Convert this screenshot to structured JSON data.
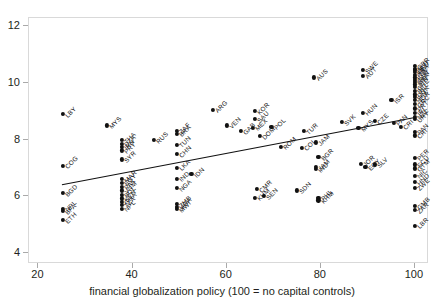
{
  "chart_data": {
    "type": "scatter",
    "title": "",
    "xlabel": "financial globalization policy (100 = no capital controls)",
    "ylabel": "",
    "xlim": [
      18,
      103
    ],
    "ylim": [
      3.6,
      12.3
    ],
    "xticks": [
      20,
      40,
      60,
      80,
      100
    ],
    "yticks": [
      4,
      6,
      8,
      10,
      12
    ],
    "grid": false,
    "legend": null,
    "point_color": "#111111",
    "fit_line": {
      "label": "linear fit",
      "x": [
        25,
        100
      ],
      "y": [
        6.4,
        8.78
      ],
      "color": "#111111"
    },
    "points": [
      {
        "label": "LBY",
        "x": 25.2,
        "y": 8.9
      },
      {
        "label": "COG",
        "x": 25.2,
        "y": 7.08
      },
      {
        "label": "BGD",
        "x": 25.2,
        "y": 6.1
      },
      {
        "label": "NPL",
        "x": 25.2,
        "y": 5.55
      },
      {
        "label": "BFA",
        "x": 25.2,
        "y": 5.47
      },
      {
        "label": "ETH",
        "x": 25.2,
        "y": 5.15
      },
      {
        "label": "MYS",
        "x": 34.5,
        "y": 8.5
      },
      {
        "label": "THA",
        "x": 37.8,
        "y": 7.98
      },
      {
        "label": "DZA",
        "x": 37.8,
        "y": 7.86
      },
      {
        "label": "IRN",
        "x": 37.8,
        "y": 7.74
      },
      {
        "label": "PRY",
        "x": 37.8,
        "y": 7.62
      },
      {
        "label": "SYR",
        "x": 37.8,
        "y": 7.3
      },
      {
        "label": "MAR",
        "x": 37.8,
        "y": 6.6
      },
      {
        "label": "EGY",
        "x": 37.8,
        "y": 6.48
      },
      {
        "label": "PAK",
        "x": 37.8,
        "y": 6.34
      },
      {
        "label": "VNM",
        "x": 37.8,
        "y": 6.2
      },
      {
        "label": "BOL",
        "x": 37.8,
        "y": 6.05
      },
      {
        "label": "KEN",
        "x": 37.8,
        "y": 5.92
      },
      {
        "label": "GHA",
        "x": 37.8,
        "y": 5.8
      },
      {
        "label": "TZA",
        "x": 37.8,
        "y": 5.7
      },
      {
        "label": "NPL",
        "x": 37.8,
        "y": 5.55
      },
      {
        "label": "RUS",
        "x": 44.5,
        "y": 7.98
      },
      {
        "label": "ZAF",
        "x": 49.5,
        "y": 8.32
      },
      {
        "label": "BRA",
        "x": 49.5,
        "y": 8.2
      },
      {
        "label": "TUN",
        "x": 49.5,
        "y": 7.82
      },
      {
        "label": "CHN",
        "x": 49.5,
        "y": 7.48
      },
      {
        "label": "LKA",
        "x": 49.5,
        "y": 7.0
      },
      {
        "label": "IND",
        "x": 49.5,
        "y": 6.62
      },
      {
        "label": "IDN",
        "x": 52.5,
        "y": 6.78
      },
      {
        "label": "NGA",
        "x": 49.5,
        "y": 6.28
      },
      {
        "label": "ZMB",
        "x": 49.5,
        "y": 5.72
      },
      {
        "label": "UGA",
        "x": 49.5,
        "y": 5.62
      },
      {
        "label": "MWI",
        "x": 49.5,
        "y": 5.54
      },
      {
        "label": "ARG",
        "x": 57.0,
        "y": 9.05
      },
      {
        "label": "VEN",
        "x": 60.0,
        "y": 8.5
      },
      {
        "label": "KOR",
        "x": 66.0,
        "y": 9.0
      },
      {
        "label": "SAU",
        "x": 66.0,
        "y": 8.72
      },
      {
        "label": "GAB",
        "x": 63.0,
        "y": 8.3
      },
      {
        "label": "MEX",
        "x": 65.5,
        "y": 8.42
      },
      {
        "label": "DOM",
        "x": 67.0,
        "y": 8.12
      },
      {
        "label": "POL",
        "x": 69.5,
        "y": 8.45
      },
      {
        "label": "ROM",
        "x": 71.5,
        "y": 7.75
      },
      {
        "label": "CMR",
        "x": 66.5,
        "y": 6.25
      },
      {
        "label": "KHM",
        "x": 66.0,
        "y": 5.95
      },
      {
        "label": "SEN",
        "x": 68.0,
        "y": 6.0
      },
      {
        "label": "AUS",
        "x": 78.5,
        "y": 10.2
      },
      {
        "label": "TUR",
        "x": 76.5,
        "y": 8.3
      },
      {
        "label": "COL",
        "x": 76.0,
        "y": 7.72
      },
      {
        "label": "JAM",
        "x": 79.0,
        "y": 7.9
      },
      {
        "label": "BGR",
        "x": 79.5,
        "y": 7.38
      },
      {
        "label": "IND",
        "x": 79.0,
        "y": 6.95
      },
      {
        "label": "JAM",
        "x": 79.0,
        "y": 7.02
      },
      {
        "label": "SVK",
        "x": 84.5,
        "y": 8.62
      },
      {
        "label": "SDN",
        "x": 75.0,
        "y": 6.2
      },
      {
        "label": "PHL",
        "x": 79.5,
        "y": 5.95
      },
      {
        "label": "KHM",
        "x": 79.5,
        "y": 5.85
      },
      {
        "label": "SWE",
        "x": 89.0,
        "y": 10.45
      },
      {
        "label": "AUT",
        "x": 89.0,
        "y": 10.25
      },
      {
        "label": "HUN",
        "x": 89.0,
        "y": 8.95
      },
      {
        "label": "MYS",
        "x": 88.0,
        "y": 8.4
      },
      {
        "label": "CZE",
        "x": 91.5,
        "y": 8.65
      },
      {
        "label": "JOR",
        "x": 88.5,
        "y": 7.15
      },
      {
        "label": "EGY",
        "x": 89.5,
        "y": 7.02
      },
      {
        "label": "SLV",
        "x": 91.5,
        "y": 7.12
      },
      {
        "label": "ISR",
        "x": 95.0,
        "y": 9.4
      },
      {
        "label": "PAN",
        "x": 95.5,
        "y": 8.6
      },
      {
        "label": "CRI",
        "x": 97.0,
        "y": 8.45
      },
      {
        "label": "GBR",
        "x": 100.0,
        "y": 10.6
      },
      {
        "label": "NLD",
        "x": 100.0,
        "y": 10.5
      },
      {
        "label": "DEU",
        "x": 100.0,
        "y": 10.45
      },
      {
        "label": "FRA",
        "x": 100.0,
        "y": 10.38
      },
      {
        "label": "ITA",
        "x": 100.0,
        "y": 10.3
      },
      {
        "label": "ESP",
        "x": 100.0,
        "y": 10.2
      },
      {
        "label": "CAN",
        "x": 100.0,
        "y": 10.12
      },
      {
        "label": "USA",
        "x": 100.0,
        "y": 10.05
      },
      {
        "label": "JPN",
        "x": 100.0,
        "y": 9.95
      },
      {
        "label": "CHE",
        "x": 100.0,
        "y": 9.85
      },
      {
        "label": "BEL",
        "x": 100.0,
        "y": 9.72
      },
      {
        "label": "DNK",
        "x": 100.0,
        "y": 9.6
      },
      {
        "label": "FIN",
        "x": 100.0,
        "y": 9.5
      },
      {
        "label": "NOR",
        "x": 100.0,
        "y": 9.4
      },
      {
        "label": "GRC",
        "x": 100.0,
        "y": 9.25
      },
      {
        "label": "PRT",
        "x": 100.0,
        "y": 9.1
      },
      {
        "label": "IRL",
        "x": 100.0,
        "y": 8.95
      },
      {
        "label": "NZL",
        "x": 100.0,
        "y": 8.8
      },
      {
        "label": "URY",
        "x": 100.0,
        "y": 8.72
      },
      {
        "label": "PAN",
        "x": 100.0,
        "y": 8.28
      },
      {
        "label": "CRI",
        "x": 100.0,
        "y": 8.15
      },
      {
        "label": "PER",
        "x": 100.0,
        "y": 7.35
      },
      {
        "label": "ECU",
        "x": 100.0,
        "y": 7.12
      },
      {
        "label": "GTM",
        "x": 100.0,
        "y": 6.98
      },
      {
        "label": "NIC",
        "x": 100.0,
        "y": 6.72
      },
      {
        "label": "HND",
        "x": 100.0,
        "y": 6.5
      },
      {
        "label": "ZWE",
        "x": 100.0,
        "y": 6.3
      },
      {
        "label": "GMB",
        "x": 100.0,
        "y": 5.65
      },
      {
        "label": "ZAR",
        "x": 100.0,
        "y": 5.5
      },
      {
        "label": "LBR",
        "x": 100.0,
        "y": 4.95
      }
    ]
  },
  "axes": {
    "x_tick_labels": [
      "20",
      "40",
      "60",
      "80",
      "100"
    ],
    "y_tick_labels": [
      "12",
      "10",
      "8",
      "6",
      "4"
    ],
    "x_title": "financial globalization policy (100 = no capital controls)"
  }
}
